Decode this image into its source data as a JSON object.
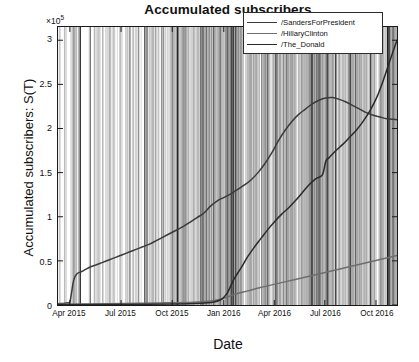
{
  "chart_data": {
    "type": "line",
    "title": "Accumulated subscribers",
    "xlabel": "Date",
    "ylabel": "Accumulated subscribers: S(T)",
    "y_multiplier": "×10",
    "y_multiplier_exp": "5",
    "grid": false,
    "legend_position": "top-right",
    "xlim": [
      "2015-03-20",
      "2016-11-20"
    ],
    "ylim": [
      0,
      315000
    ],
    "yticks": [
      0,
      0.5,
      1,
      1.5,
      2,
      2.5,
      3
    ],
    "ytick_labels": [
      "0",
      "0.5",
      "1",
      "1.5",
      "2",
      "2.5",
      "3"
    ],
    "xticks": [
      "Apr 2015",
      "Jul 2015",
      "Oct 2015",
      "Jan 2016",
      "Apr 2016",
      "Jul 2016",
      "Oct 2016"
    ],
    "xtick_positions": [
      0.035,
      0.186,
      0.337,
      0.489,
      0.638,
      0.787,
      0.938
    ],
    "annotation_lines": "dense vertical event lines spanning full plot height",
    "series": [
      {
        "name": "/SandersForPresident",
        "color": "#3a3a3a",
        "x": [
          0.0,
          0.02,
          0.03,
          0.035,
          0.04,
          0.045,
          0.05,
          0.055,
          0.06,
          0.07,
          0.08,
          0.095,
          0.11,
          0.13,
          0.15,
          0.17,
          0.19,
          0.21,
          0.23,
          0.25,
          0.27,
          0.29,
          0.31,
          0.33,
          0.35,
          0.37,
          0.39,
          0.41,
          0.43,
          0.45,
          0.47,
          0.49,
          0.51,
          0.53,
          0.55,
          0.57,
          0.59,
          0.61,
          0.63,
          0.65,
          0.67,
          0.69,
          0.71,
          0.73,
          0.75,
          0.77,
          0.79,
          0.81,
          0.83,
          0.85,
          0.87,
          0.89,
          0.91,
          0.93,
          0.95,
          0.97,
          1.0
        ],
        "values": [
          1500,
          2000,
          2500,
          3000,
          14000,
          26000,
          32000,
          35000,
          36500,
          38000,
          40000,
          43000,
          45000,
          48000,
          51000,
          54000,
          57000,
          60000,
          63000,
          66000,
          69000,
          73000,
          77000,
          81000,
          85000,
          89000,
          94000,
          99000,
          104000,
          112000,
          118000,
          122000,
          126000,
          131000,
          136000,
          142000,
          150000,
          160000,
          172000,
          186000,
          198000,
          208000,
          216000,
          222000,
          228000,
          232000,
          234500,
          235000,
          233000,
          230000,
          226000,
          222000,
          218000,
          215000,
          213000,
          211000,
          210000
        ]
      },
      {
        "name": "/HillaryClinton",
        "color": "#6e6e6e",
        "x": [
          0.0,
          0.1,
          0.2,
          0.3,
          0.4,
          0.45,
          0.48,
          0.5,
          0.52,
          0.56,
          0.6,
          0.65,
          0.7,
          0.75,
          0.8,
          0.85,
          0.9,
          0.95,
          1.0
        ],
        "values": [
          800,
          1200,
          1700,
          2300,
          3200,
          4500,
          6500,
          9000,
          12000,
          16000,
          20000,
          24500,
          29000,
          33500,
          38000,
          42500,
          47000,
          51500,
          56000
        ]
      },
      {
        "name": "/The_Donald",
        "color": "#2a2a2a",
        "x": [
          0.0,
          0.2,
          0.35,
          0.42,
          0.46,
          0.48,
          0.49,
          0.5,
          0.51,
          0.52,
          0.54,
          0.56,
          0.58,
          0.6,
          0.62,
          0.64,
          0.66,
          0.68,
          0.7,
          0.72,
          0.74,
          0.76,
          0.78,
          0.79,
          0.8,
          0.82,
          0.84,
          0.86,
          0.88,
          0.9,
          0.92,
          0.94,
          0.96,
          0.98,
          1.0
        ],
        "values": [
          300,
          600,
          1200,
          2000,
          3500,
          6000,
          9000,
          14000,
          22000,
          30000,
          42000,
          55000,
          66000,
          76000,
          86000,
          95000,
          103000,
          110000,
          118000,
          127000,
          136000,
          143000,
          147500,
          163000,
          167000,
          175000,
          182000,
          190000,
          198000,
          208000,
          220000,
          235000,
          255000,
          278000,
          300000
        ]
      }
    ]
  }
}
